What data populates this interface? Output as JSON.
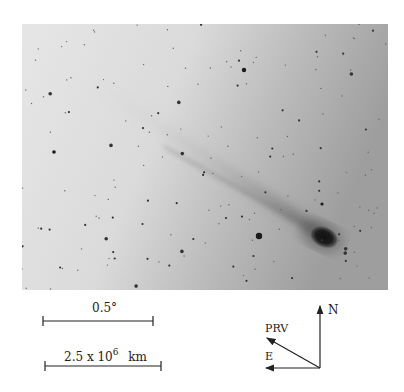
{
  "figure": {
    "image_tone": "grayscale negative (dark objects on light background)",
    "scale_bars": [
      {
        "label": "0.5°"
      },
      {
        "label_main": "2.5 x 10",
        "label_exp": "6",
        "label_unit": "km"
      }
    ],
    "compass": {
      "north_label": "N",
      "east_label": "E",
      "prv_label": "PRV"
    }
  }
}
